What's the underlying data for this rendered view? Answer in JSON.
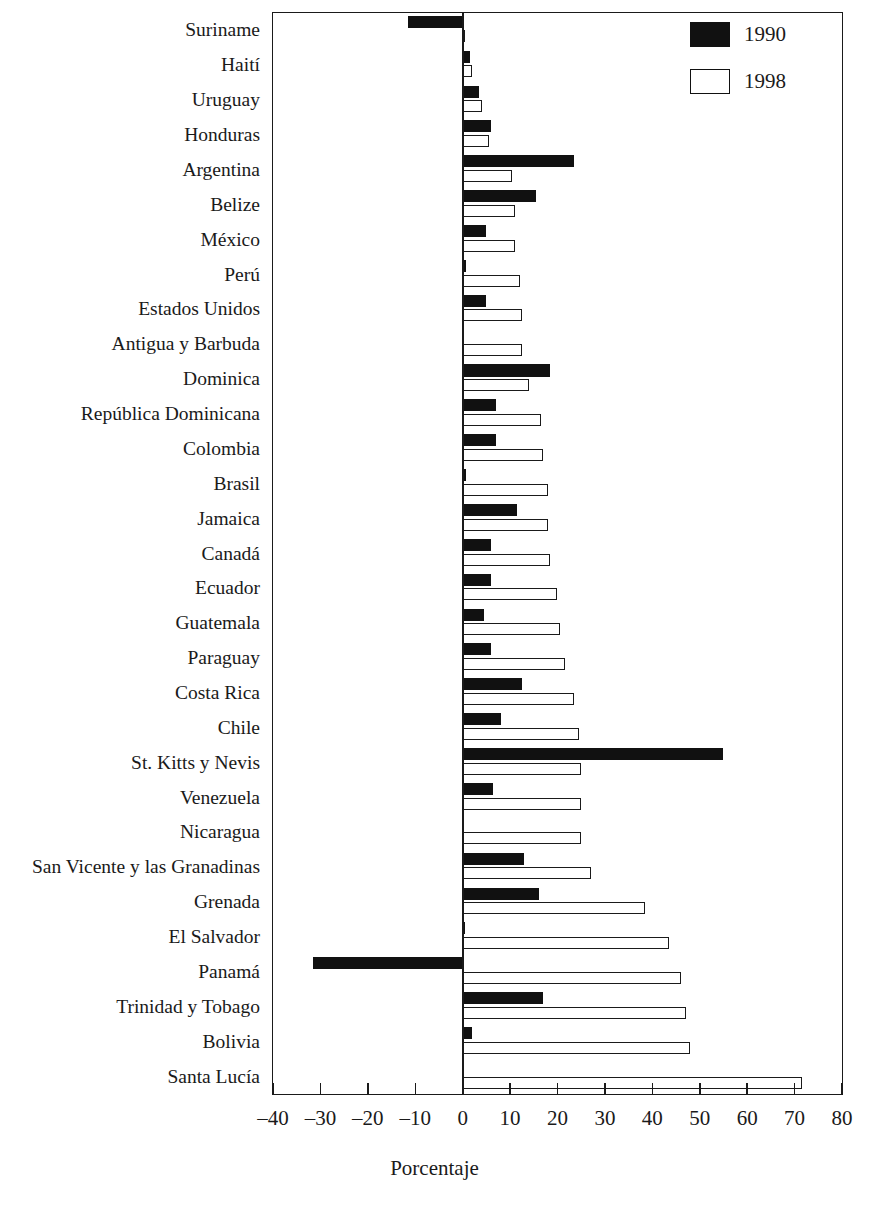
{
  "chart_data": {
    "type": "bar",
    "orientation": "horizontal",
    "title": "",
    "xlabel": "Porcentaje",
    "ylabel": "",
    "xlim": [
      -40,
      80
    ],
    "xticks": [
      -40,
      -30,
      -20,
      -10,
      0,
      10,
      20,
      30,
      40,
      50,
      60,
      70,
      80
    ],
    "xtick_labels": [
      "–40",
      "–30",
      "–20",
      "–10",
      "0",
      "10",
      "20",
      "30",
      "40",
      "50",
      "60",
      "70",
      "80"
    ],
    "grid": false,
    "legend_position": "top-right",
    "categories": [
      "Suriname",
      "Haití",
      "Uruguay",
      "Honduras",
      "Argentina",
      "Belize",
      "México",
      "Perú",
      "Estados Unidos",
      "Antigua y Barbuda",
      "Dominica",
      "República Dominicana",
      "Colombia",
      "Brasil",
      "Jamaica",
      "Canadá",
      "Ecuador",
      "Guatemala",
      "Paraguay",
      "Costa Rica",
      "Chile",
      "St. Kitts y Nevis",
      "Venezuela",
      "Nicaragua",
      "San Vicente y las Granadinas",
      "Grenada",
      "El Salvador",
      "Panamá",
      "Trinidad y Tobago",
      "Bolivia",
      "Santa Lucía"
    ],
    "series": [
      {
        "name": "1990",
        "color": "#111111",
        "values": [
          -11.5,
          1.5,
          3.5,
          6.0,
          23.5,
          15.5,
          5.0,
          0.7,
          5.0,
          0.0,
          18.5,
          7.0,
          7.0,
          0.7,
          11.5,
          6.0,
          6.0,
          4.5,
          6.0,
          12.5,
          8.0,
          55.0,
          6.5,
          0.0,
          13.0,
          16.0,
          0.5,
          -31.5,
          17.0,
          2.0,
          0.0
        ]
      },
      {
        "name": "1998",
        "color": "#ffffff",
        "values": [
          0.5,
          2.0,
          4.0,
          5.5,
          10.5,
          11.0,
          11.0,
          12.0,
          12.5,
          12.5,
          14.0,
          16.5,
          17.0,
          18.0,
          18.0,
          18.5,
          20.0,
          20.5,
          21.5,
          23.5,
          24.5,
          25.0,
          25.0,
          25.0,
          27.0,
          38.5,
          43.5,
          46.0,
          47.0,
          48.0,
          71.5
        ]
      }
    ]
  },
  "legend": {
    "entries": [
      {
        "label": "1990",
        "swatch": "filled"
      },
      {
        "label": "1998",
        "swatch": "hollow"
      }
    ]
  }
}
